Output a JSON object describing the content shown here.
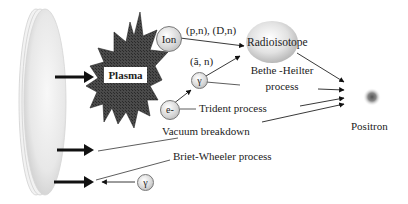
{
  "diagram": {
    "title": "",
    "nodes": {
      "plasma": "Plasma",
      "ion": "Ion",
      "gamma_upper": "γ",
      "electron": "e-",
      "gamma_lower": "γ",
      "radioisotope": "Radioisotope",
      "positron": "Positron"
    },
    "edge_labels": {
      "ion_reactions": "(p,n), (D,n)",
      "gamma_reaction": "(ã, n)",
      "bethe_heitler_line1": "Bethe -Heilter",
      "bethe_heitler_line2": "process",
      "trident": "Trident process",
      "vacuum": "Vacuum breakdown",
      "briet_wheeler": "Briet-Wheeler process"
    },
    "colors": {
      "arrow": "#111111",
      "plasma_fill": "#3a3a3a",
      "target": "#e6e6e6",
      "particle": "#cfcfcf",
      "text": "#222222"
    }
  }
}
